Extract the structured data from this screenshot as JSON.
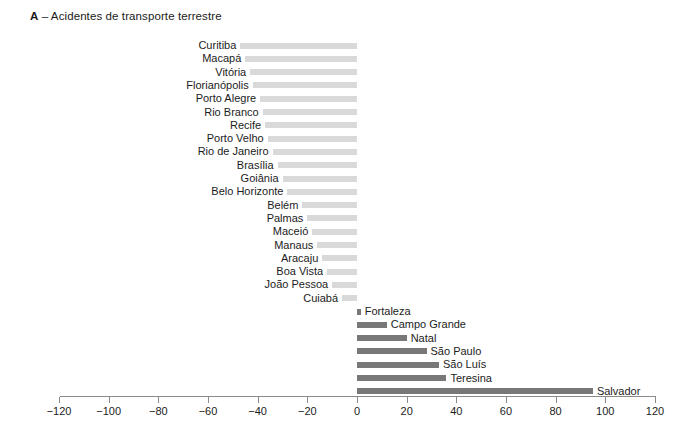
{
  "chart_data": {
    "type": "bar",
    "orientation": "horizontal",
    "title": "A – Acidentes de transporte terrestre",
    "panel_letter": "A",
    "title_text": "– Acidentes de transporte terrestre",
    "xlabel": "",
    "ylabel": "",
    "xlim": [
      -120,
      120
    ],
    "xticks": [
      -120,
      -100,
      -80,
      -60,
      -40,
      -20,
      0,
      20,
      40,
      60,
      80,
      100,
      120
    ],
    "xticklabels": [
      "-120",
      "-100",
      "-80",
      "-60",
      "-40",
      "-20",
      "0",
      "20",
      "40",
      "60",
      "80",
      "100",
      "120"
    ],
    "grid": false,
    "legend": null,
    "colors": {
      "negative_bar": "#d9d9d9",
      "positive_bar": "#787878",
      "axis": "#8a8a8a",
      "text": "#1c1c1c"
    },
    "categories": [
      "Curitiba",
      "Macapá",
      "Vitória",
      "Florianópolis",
      "Porto Alegre",
      "Rio Branco",
      "Recife",
      "Porto Velho",
      "Rio de Janeiro",
      "Brasília",
      "Goiânia",
      "Belo Horizonte",
      "Belém",
      "Palmas",
      "Maceió",
      "Manaus",
      "Aracaju",
      "Boa Vista",
      "João Pessoa",
      "Cuiabá",
      "Fortaleza",
      "Campo Grande",
      "Natal",
      "São Paulo",
      "São Luís",
      "Teresina",
      "Salvador"
    ],
    "values": [
      -47,
      -45,
      -43,
      -42,
      -39,
      -38,
      -37,
      -36,
      -34,
      -32,
      -30,
      -28,
      -22,
      -20,
      -18,
      -16,
      -14,
      -12,
      -10,
      -6,
      1.5,
      12,
      20,
      28,
      33,
      36,
      95
    ]
  }
}
